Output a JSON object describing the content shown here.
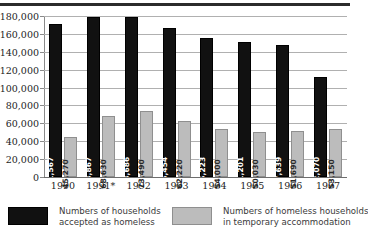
{
  "chart_data": {
    "type": "bar",
    "title": "",
    "subtitle": "",
    "xlabel": "",
    "ylabel": "",
    "ylim": [
      0,
      180000
    ],
    "ytick_step": 20000,
    "grid": true,
    "legend_position": "bottom",
    "categories": [
      "1990",
      "1991*",
      "1992",
      "1993",
      "1994",
      "1995",
      "1996",
      "1997"
    ],
    "yticks": [
      "0",
      "20,000",
      "40,000",
      "60,000",
      "80,000",
      "100,000",
      "120,000",
      "140,000",
      "160,000",
      "180,000"
    ],
    "ytick_values": [
      0,
      20000,
      40000,
      60000,
      80000,
      100000,
      120000,
      140000,
      160000,
      180000
    ],
    "series": [
      {
        "name": "Numbers of households accepted as homeless",
        "color": "#111111",
        "values": [
          171567,
          178867,
          178686,
          166454,
          155223,
          151201,
          147639,
          112070
        ],
        "labels": [
          "171,567",
          "178,867",
          "178,686",
          "166,454",
          "155,223",
          "151,201",
          "147,639",
          "112,070"
        ]
      },
      {
        "name": "Numbers of homeless households in temporary accommodation",
        "color": "#bcbcbc",
        "values": [
          45270,
          68630,
          73490,
          62220,
          54000,
          50030,
          51690,
          53150
        ],
        "labels": [
          "45,270",
          "68,630",
          "73,490",
          "62,220",
          "54,000",
          "50,030",
          "51,690",
          "53,150"
        ]
      }
    ],
    "annotations": [
      "1991*"
    ]
  },
  "legend": {
    "items": [
      {
        "line1": "Numbers of households",
        "line2": "accepted as homeless",
        "swatch": "dark-swatch"
      },
      {
        "line1": "Numbers of homeless households",
        "line2": "in temporary accommodation",
        "swatch": "light-swatch"
      }
    ]
  }
}
